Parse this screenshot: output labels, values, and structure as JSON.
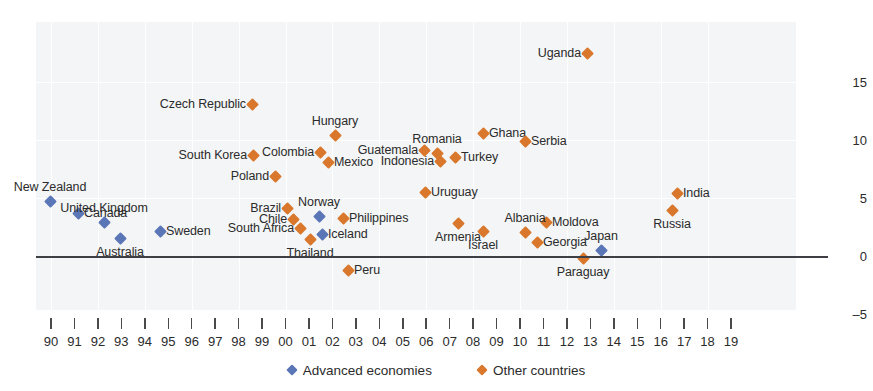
{
  "chart_data": {
    "type": "scatter",
    "title": "",
    "subtitle": "",
    "xlabel": "",
    "ylabel": "",
    "xlim": [
      1989.5,
      2019.5
    ],
    "ylim": [
      -5,
      17.5
    ],
    "yticks": [
      15,
      10,
      5,
      0,
      -5
    ],
    "ytick_labels": [
      "15",
      "10",
      "5",
      "0",
      "–5"
    ],
    "xticks": [
      1990,
      1991,
      1992,
      1993,
      1994,
      1995,
      1996,
      1997,
      1998,
      1999,
      2000,
      2001,
      2002,
      2003,
      2004,
      2005,
      2006,
      2007,
      2008,
      2009,
      2010,
      2011,
      2012,
      2013,
      2014,
      2015,
      2016,
      2017,
      2018,
      2019
    ],
    "xtick_labels": [
      "90",
      "91",
      "92",
      "93",
      "94",
      "95",
      "96",
      "97",
      "98",
      "99",
      "00",
      "01",
      "02",
      "03",
      "04",
      "05",
      "06",
      "07",
      "08",
      "09",
      "10",
      "11",
      "12",
      "13",
      "14",
      "15",
      "16",
      "17",
      "18",
      "19"
    ],
    "grid": true,
    "legend_position": "bottom",
    "zero_line": true,
    "series": [
      {
        "name": "Advanced economies",
        "color": "#5b76b7",
        "points": [
          {
            "label": "New Zealand",
            "x": 1990.0,
            "y": 4.6,
            "px": 50,
            "py": 201,
            "label_pos": "above"
          },
          {
            "label": "Canada",
            "x": 1991.3,
            "y": 4.0,
            "px": 78,
            "py": 213,
            "label_pos": "right"
          },
          {
            "label": "United Kingdom",
            "x": 1992.3,
            "y": 2.6,
            "px": 104,
            "py": 222,
            "label_pos": "above"
          },
          {
            "label": "Australia",
            "x": 1993.2,
            "y": 1.4,
            "px": 120,
            "py": 238,
            "label_pos": "below"
          },
          {
            "label": "Sweden",
            "x": 1995.0,
            "y": 1.7,
            "px": 160,
            "py": 231,
            "label_pos": "right"
          },
          {
            "label": "Norway",
            "x": 2000.9,
            "y": 2.4,
            "px": 319,
            "py": 216,
            "label_pos": "above"
          },
          {
            "label": "Iceland",
            "x": 2001.0,
            "y": 1.5,
            "px": 322,
            "py": 234,
            "label_pos": "right"
          },
          {
            "label": "Japan",
            "x": 2011.6,
            "y": 0.1,
            "px": 601,
            "py": 250,
            "label_pos": "above"
          }
        ]
      },
      {
        "name": "Other countries",
        "color": "#d9782d",
        "points": [
          {
            "label": "Czech Republic",
            "x": 1997.5,
            "y": 11.4,
            "px": 252,
            "py": 104,
            "label_pos": "left"
          },
          {
            "label": "Uganda",
            "x": 2011.2,
            "y": 16.4,
            "px": 587,
            "py": 53,
            "label_pos": "left"
          },
          {
            "label": "Ghana",
            "x": 2007.0,
            "y": 9.9,
            "px": 483,
            "py": 133,
            "label_pos": "right"
          },
          {
            "label": "Serbia",
            "x": 2008.6,
            "y": 9.2,
            "px": 525,
            "py": 141,
            "label_pos": "right"
          },
          {
            "label": "Hungary",
            "x": 2001.3,
            "y": 9.4,
            "px": 335,
            "py": 135,
            "label_pos": "above"
          },
          {
            "label": "Colombia",
            "x": 2000.0,
            "y": 7.8,
            "px": 320,
            "py": 152,
            "label_pos": "left"
          },
          {
            "label": "South Korea",
            "x": 1997.6,
            "y": 7.6,
            "px": 253,
            "py": 155,
            "label_pos": "left"
          },
          {
            "label": "Guatemala",
            "x": 2005.0,
            "y": 8.0,
            "px": 424,
            "py": 150,
            "label_pos": "left"
          },
          {
            "label": "Romania",
            "x": 2005.5,
            "y": 7.8,
            "px": 437,
            "py": 153,
            "label_pos": "above"
          },
          {
            "label": "Mexico",
            "x": 2000.7,
            "y": 6.9,
            "px": 328,
            "py": 162,
            "label_pos": "right"
          },
          {
            "label": "Indonesia",
            "x": 2005.7,
            "y": 7.0,
            "px": 440,
            "py": 161,
            "label_pos": "left"
          },
          {
            "label": "Turkey",
            "x": 2006.2,
            "y": 7.2,
            "px": 455,
            "py": 157,
            "label_pos": "right"
          },
          {
            "label": "Poland",
            "x": 1998.5,
            "y": 5.6,
            "px": 275,
            "py": 176,
            "label_pos": "left"
          },
          {
            "label": "India",
            "x": 2014.6,
            "y": 4.7,
            "px": 677,
            "py": 193,
            "label_pos": "right"
          },
          {
            "label": "Uruguay",
            "x": 2005.0,
            "y": 4.8,
            "px": 425,
            "py": 192,
            "label_pos": "right"
          },
          {
            "label": "Brazil",
            "x": 1999.5,
            "y": 3.3,
            "px": 287,
            "py": 208,
            "label_pos": "left"
          },
          {
            "label": "Russia",
            "x": 2014.5,
            "y": 3.2,
            "px": 672,
            "py": 210,
            "label_pos": "below"
          },
          {
            "label": "Chile",
            "x": 1999.7,
            "y": 2.4,
            "px": 293,
            "py": 219,
            "label_pos": "left"
          },
          {
            "label": "Philippines",
            "x": 2001.7,
            "y": 2.5,
            "px": 343,
            "py": 218,
            "label_pos": "right"
          },
          {
            "label": "Moldova",
            "x": 2008.9,
            "y": 2.8,
            "px": 546,
            "py": 222,
            "label_pos": "right"
          },
          {
            "label": "Armenia",
            "x": 2006.5,
            "y": 2.1,
            "px": 458,
            "py": 223,
            "label_pos": "below"
          },
          {
            "label": "South Africa",
            "x": 1999.9,
            "y": 1.7,
            "px": 300,
            "py": 228,
            "label_pos": "left"
          },
          {
            "label": "Albania",
            "x": 2008.4,
            "y": 1.5,
            "px": 525,
            "py": 232,
            "label_pos": "above"
          },
          {
            "label": "Israel",
            "x": 2007.0,
            "y": 1.5,
            "px": 483,
            "py": 231,
            "label_pos": "below"
          },
          {
            "label": "Thailand",
            "x": 2000.3,
            "y": 1.1,
            "px": 310,
            "py": 239,
            "label_pos": "below"
          },
          {
            "label": "Georgia",
            "x": 2009.3,
            "y": 0.7,
            "px": 537,
            "py": 242,
            "label_pos": "right"
          },
          {
            "label": "Paraguay",
            "x": 2010.9,
            "y": -0.1,
            "px": 583,
            "py": 258,
            "label_pos": "below"
          },
          {
            "label": "Peru",
            "x": 2001.8,
            "y": -1.1,
            "px": 348,
            "py": 270,
            "label_pos": "right"
          }
        ]
      }
    ]
  },
  "legend": {
    "items": [
      {
        "label": "Advanced economies",
        "color": "#5b76b7"
      },
      {
        "label": "Other countries",
        "color": "#d9782d"
      }
    ]
  }
}
